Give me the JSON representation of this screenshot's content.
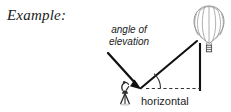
{
  "figure": {
    "caption_label": "Example:",
    "type": "geometry-diagram",
    "topic": "angle of elevation"
  },
  "labels": {
    "angle_line1": "angle of",
    "angle_line2": "elevation",
    "horizontal": "horizontal"
  },
  "icons": {
    "balloon": "hot-air-balloon-icon",
    "observer": "surveyor-observer-icon",
    "pointer": "leader-arrow-icon",
    "angle_arc": "angle-arc-icon"
  },
  "colors": {
    "ink": "#1a1a1a",
    "line": "#111111",
    "balloon_outline": "#8c8c8c",
    "dashed": "#3a3a3a",
    "background": "#ffffff"
  },
  "geometry": {
    "vertex": [
      141,
      88
    ],
    "balloon_center": [
      209,
      22
    ],
    "sight_line_end": [
      197,
      42
    ],
    "vertical_line": {
      "x": 200,
      "y_top": 44,
      "y_bottom": 90
    },
    "horizontal_dashed": {
      "x_start": 146,
      "x_end": 200,
      "y": 88
    },
    "angle_arc_radius": 18,
    "angle_degrees": 36
  }
}
